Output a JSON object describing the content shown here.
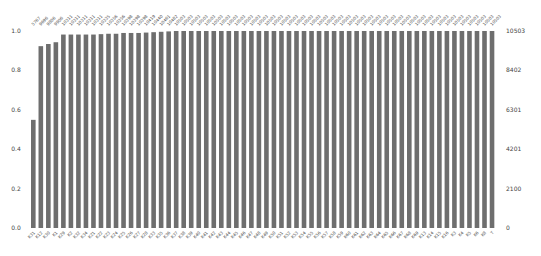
{
  "chart_data": {
    "type": "bar",
    "title": "",
    "xlabel": "",
    "ylabel": "",
    "ylim": [
      0,
      1.0
    ],
    "left_axis_ticks": [
      "0.0",
      "0.2",
      "0.4",
      "0.6",
      "0.8",
      "1.0"
    ],
    "right_axis_ticks": [
      "0",
      "2100",
      "4201",
      "6301",
      "8402",
      "10503"
    ],
    "total_count": 10503,
    "grid": false,
    "bar_color": "#6e6e6e",
    "categories": [
      "K31",
      "K12",
      "K30",
      "K1",
      "K29",
      "K2",
      "K32",
      "K34",
      "K21",
      "K22",
      "K23",
      "K24",
      "K25",
      "K26",
      "K27",
      "K28",
      "K33",
      "K35",
      "K36",
      "K37",
      "K38",
      "K39",
      "K40",
      "K41",
      "K42",
      "K43",
      "K44",
      "K45",
      "K46",
      "K47",
      "K48",
      "K49",
      "K50",
      "K51",
      "K52",
      "K53",
      "K54",
      "K55",
      "K56",
      "K57",
      "K58",
      "K59",
      "K60",
      "K61",
      "K62",
      "K63",
      "K64",
      "K65",
      "K66",
      "K67",
      "K68",
      "K69",
      "K13",
      "K14",
      "K15",
      "K16",
      "K3",
      "K4",
      "K5",
      "K6",
      "K8",
      "T"
    ],
    "values": [
      0.549,
      0.923,
      0.934,
      0.943,
      0.982,
      0.982,
      0.982,
      0.982,
      0.982,
      0.984,
      0.986,
      0.986,
      0.99,
      0.99,
      0.99,
      0.992,
      0.994,
      0.996,
      0.998,
      1.0,
      1.0,
      1.0,
      1.0,
      1.0,
      1.0,
      1.0,
      1.0,
      1.0,
      1.0,
      1.0,
      1.0,
      1.0,
      1.0,
      1.0,
      1.0,
      1.0,
      1.0,
      1.0,
      1.0,
      1.0,
      1.0,
      1.0,
      1.0,
      1.0,
      1.0,
      1.0,
      1.0,
      1.0,
      1.0,
      1.0,
      1.0,
      1.0,
      1.0,
      1.0,
      1.0,
      1.0,
      1.0,
      1.0,
      1.0,
      1.0,
      1.0,
      1.0
    ],
    "counts": [
      5767,
      9696,
      9806,
      9906,
      10311,
      10311,
      10311,
      10311,
      10311,
      10335,
      10356,
      10356,
      10398,
      10398,
      10398,
      10419,
      10440,
      10461,
      10482,
      10503,
      10503,
      10503,
      10503,
      10503,
      10503,
      10503,
      10503,
      10503,
      10503,
      10503,
      10503,
      10503,
      10503,
      10503,
      10503,
      10503,
      10503,
      10503,
      10503,
      10503,
      10503,
      10503,
      10503,
      10503,
      10503,
      10503,
      10503,
      10503,
      10503,
      10503,
      10503,
      10503,
      10503,
      10503,
      10503,
      10503,
      10503,
      10503,
      10503,
      10503,
      10503,
      10503
    ]
  }
}
